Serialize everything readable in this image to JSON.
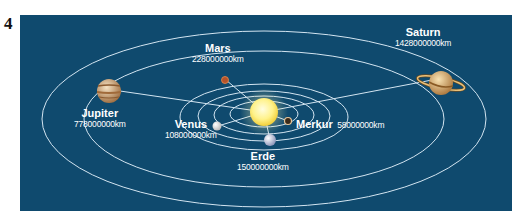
{
  "figure_number": "4",
  "diagram": {
    "background_color": "#0f4a6e",
    "orbit_color": "#cfe3f0",
    "sun": {
      "label": "",
      "color": "#fff6a8"
    },
    "planets": [
      {
        "name": "Merkur",
        "distance": "58000000km",
        "color": "#caa37a"
      },
      {
        "name": "Venus",
        "distance": "108000000km",
        "color": "#f2f2f2"
      },
      {
        "name": "Erde",
        "distance": "150000000km",
        "color": "#d7dbea"
      },
      {
        "name": "Mars",
        "distance": "228000000km",
        "color": "#b5522a"
      },
      {
        "name": "Jupiter",
        "distance": "778000000km",
        "color": "#d9b58a"
      },
      {
        "name": "Saturn",
        "distance": "1428000000km",
        "color": "#e0b878"
      }
    ]
  }
}
